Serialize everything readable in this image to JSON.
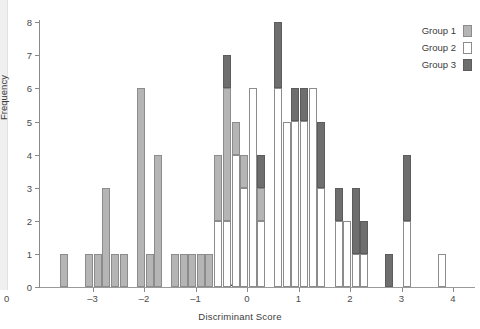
{
  "chart_data": {
    "type": "bar",
    "subtype": "stacked-histogram",
    "title": "",
    "xlabel": "Discriminant Score",
    "ylabel": "Frequency",
    "xlim": [
      -3.75,
      4.35
    ],
    "ylim": [
      0,
      8
    ],
    "xticks": [
      -3,
      -2,
      -1,
      0,
      1,
      2,
      3,
      4
    ],
    "xtick_labels": [
      "–3",
      "–2",
      "–1",
      "0",
      "1",
      "2",
      "3",
      "4"
    ],
    "yticks": [
      0,
      1,
      2,
      3,
      4,
      5,
      6,
      7,
      8
    ],
    "ytick_labels": [
      "0",
      "1",
      "2",
      "3",
      "4",
      "5",
      "6",
      "7",
      "8"
    ],
    "origin_label": "0",
    "grid": false,
    "bin_width": 0.165,
    "legend_position": "top-right",
    "series": [
      {
        "name": "Group 1",
        "color": "#b5b5b5"
      },
      {
        "name": "Group 2",
        "color": "#ffffff"
      },
      {
        "name": "Group 3",
        "color": "#6e6e6e"
      }
    ],
    "annotations": [
      {
        "kind": "triangle-marker",
        "x": -0.37,
        "y": 0,
        "color": "#1c1c1c",
        "label": ""
      }
    ],
    "bars": [
      {
        "x": -3.56,
        "g1": 1,
        "g2": 0,
        "g3": 0
      },
      {
        "x": -3.06,
        "g1": 1,
        "g2": 0,
        "g3": 0
      },
      {
        "x": -2.89,
        "g1": 1,
        "g2": 0,
        "g3": 0
      },
      {
        "x": -2.73,
        "g1": 3,
        "g2": 0,
        "g3": 0
      },
      {
        "x": -2.56,
        "g1": 1,
        "g2": 0,
        "g3": 0
      },
      {
        "x": -2.39,
        "g1": 1,
        "g2": 0,
        "g3": 0
      },
      {
        "x": -2.06,
        "g1": 6,
        "g2": 0,
        "g3": 0
      },
      {
        "x": -1.89,
        "g1": 1,
        "g2": 0,
        "g3": 0
      },
      {
        "x": -1.73,
        "g1": 4,
        "g2": 0,
        "g3": 0
      },
      {
        "x": -1.39,
        "g1": 1,
        "g2": 0,
        "g3": 0
      },
      {
        "x": -1.23,
        "g1": 1,
        "g2": 0,
        "g3": 0
      },
      {
        "x": -1.06,
        "g1": 1,
        "g2": 0,
        "g3": 0
      },
      {
        "x": -0.89,
        "g1": 1,
        "g2": 0,
        "g3": 0
      },
      {
        "x": -0.73,
        "g1": 1,
        "g2": 0,
        "g3": 0
      },
      {
        "x": -0.56,
        "g1": 2,
        "g2": 2,
        "g3": 0
      },
      {
        "x": -0.39,
        "g1": 4,
        "g2": 2,
        "g3": 1
      },
      {
        "x": -0.22,
        "g1": 1,
        "g2": 4,
        "g3": 0
      },
      {
        "x": -0.06,
        "g1": 1,
        "g2": 3,
        "g3": 0
      },
      {
        "x": 0.11,
        "g1": 0,
        "g2": 6,
        "g3": 0
      },
      {
        "x": 0.28,
        "g1": 1,
        "g2": 2,
        "g3": 1
      },
      {
        "x": 0.61,
        "g1": 0,
        "g2": 6,
        "g3": 2
      },
      {
        "x": 0.78,
        "g1": 0,
        "g2": 5,
        "g3": 0
      },
      {
        "x": 0.94,
        "g1": 0,
        "g2": 5,
        "g3": 1
      },
      {
        "x": 1.11,
        "g1": 0,
        "g2": 5,
        "g3": 1
      },
      {
        "x": 1.28,
        "g1": 0,
        "g2": 6,
        "g3": 0
      },
      {
        "x": 1.44,
        "g1": 0,
        "g2": 3,
        "g3": 2
      },
      {
        "x": 1.78,
        "g1": 0,
        "g2": 2,
        "g3": 1
      },
      {
        "x": 1.94,
        "g1": 0,
        "g2": 2,
        "g3": 0
      },
      {
        "x": 2.11,
        "g1": 0,
        "g2": 1,
        "g3": 2
      },
      {
        "x": 2.28,
        "g1": 0,
        "g2": 1,
        "g3": 1
      },
      {
        "x": 2.75,
        "g1": 0,
        "g2": 0,
        "g3": 1
      },
      {
        "x": 3.11,
        "g1": 0,
        "g2": 2,
        "g3": 2
      },
      {
        "x": 3.78,
        "g1": 0,
        "g2": 1,
        "g3": 0
      }
    ]
  },
  "legend": {
    "items": [
      {
        "label": "Group 1",
        "swatch": "g1"
      },
      {
        "label": "Group 2",
        "swatch": "g2"
      },
      {
        "label": "Group 3",
        "swatch": "g3"
      }
    ]
  }
}
